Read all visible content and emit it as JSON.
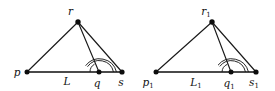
{
  "figure": {
    "background_color": "#ffffff",
    "line_color": "#1a1a1a",
    "baseline_color": "#4a4a4a",
    "vertex_color": "#0d0d0d"
  },
  "panels": [
    {
      "name": "left-figure",
      "labels": {
        "apex": "r",
        "apex_sub": "",
        "left_vertex": "p",
        "left_vertex_sub": "",
        "base_point": "q",
        "base_point_sub": "",
        "right_vertex": "s",
        "right_vertex_sub": "",
        "segment": "L",
        "segment_sub": ""
      },
      "geometry": {
        "apex": [
          78,
          22
        ],
        "left_vertex": [
          27,
          72
        ],
        "base_point": [
          99,
          72
        ],
        "right_vertex": [
          122,
          72
        ],
        "arc_radii": [
          9,
          14.5,
          17.5
        ],
        "arc_small_radius": 9
      }
    },
    {
      "name": "right-figure",
      "labels": {
        "apex": "r",
        "apex_sub": "1",
        "left_vertex": "p",
        "left_vertex_sub": "1",
        "base_point": "q",
        "base_point_sub": "1",
        "right_vertex": "s",
        "right_vertex_sub": "1",
        "segment": "L",
        "segment_sub": "1"
      },
      "geometry": {
        "apex": [
          212,
          22
        ],
        "left_vertex": [
          156,
          72
        ],
        "base_point": [
          231,
          72
        ],
        "right_vertex": [
          256,
          72
        ],
        "arc_radii": [
          9,
          14.5,
          17.5
        ],
        "arc_small_radius": 9
      }
    }
  ]
}
